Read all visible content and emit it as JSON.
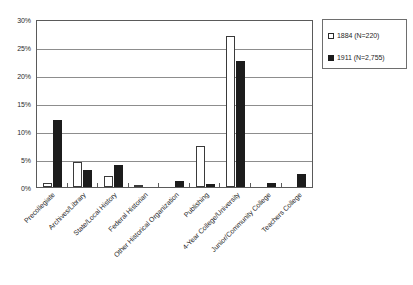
{
  "chart_data": {
    "type": "bar",
    "title": "",
    "subtitle": "",
    "xlabel": "",
    "ylabel": "",
    "ylim": [
      0,
      30
    ],
    "y_tick_labels": [
      "0%",
      "5%",
      "10%",
      "15%",
      "20%",
      "25%",
      "30%"
    ],
    "y_tick_values": [
      0,
      5,
      10,
      15,
      20,
      25,
      30
    ],
    "grid": true,
    "grid_axis": "y",
    "legend_position": "top-right",
    "value_unit": "percent",
    "categories": [
      "Precollegiate",
      "Archives/Library",
      "State/Local History",
      "Federal Historian",
      "Other Historical Organization",
      "Publishing",
      "4-Year College/University",
      "Junior/Community College",
      "Teachers College"
    ],
    "series": [
      {
        "name": "1884 (N=220)",
        "style": "open",
        "color": "#ffffff",
        "edge_color": "#3a3a3a",
        "values": [
          0.8,
          4.5,
          2.0,
          0.3,
          0.0,
          7.3,
          27.0,
          0.0,
          0.0
        ]
      },
      {
        "name": "1911 (N=2,755)",
        "style": "filled",
        "color": "#1c1c1c",
        "edge_color": "#1c1c1c",
        "values": [
          12.0,
          3.0,
          4.0,
          0.0,
          1.0,
          0.5,
          22.5,
          0.7,
          2.3
        ]
      }
    ]
  },
  "legend": {
    "entries": [
      {
        "label": "1884 (N=220)",
        "swatch": "open-square-swatch"
      },
      {
        "label": "1911 (N=2,755)",
        "swatch": "filled-square-swatch"
      }
    ]
  },
  "axis": {
    "y_ticks": [
      {
        "label": "30%",
        "value": 30
      },
      {
        "label": "25%",
        "value": 25
      },
      {
        "label": "20%",
        "value": 20
      },
      {
        "label": "15%",
        "value": 15
      },
      {
        "label": "10%",
        "value": 10
      },
      {
        "label": "5%",
        "value": 5
      },
      {
        "label": "0%",
        "value": 0
      }
    ]
  },
  "colors": {
    "series_1884": "#ffffff",
    "series_1911": "#1c1c1c",
    "gridline": "#8d8d8d",
    "frame": "#5a5a5a",
    "background": "#ffffff",
    "text": "#1f1f1f"
  }
}
